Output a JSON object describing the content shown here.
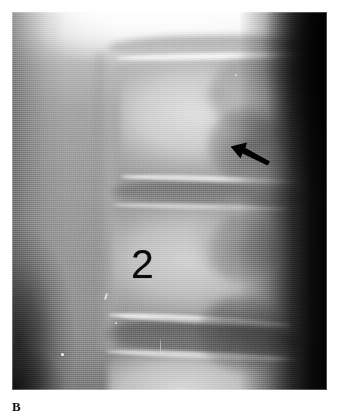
{
  "figure": {
    "panel_label": "B",
    "modality_name": "radiograph",
    "view_name": "lateral-lumbar-spine"
  },
  "radiograph": {
    "alt_description": "Lateral radiograph of the lumbar spine",
    "background_color": "#8d8d8d",
    "plate": {
      "left": 12,
      "top": 12,
      "width": 315,
      "height": 378
    },
    "tones": {
      "highlight": "#ffffff",
      "bone_bright": "#e2e2e2",
      "soft_tissue_mid": "#9a9a9a",
      "disc_dark": "#5e5e5e",
      "off_film_black": "#020202"
    }
  },
  "annotations": {
    "arrow": {
      "name": "pointer-arrow",
      "color": "#000000",
      "direction": "up-left",
      "tip_x": 219,
      "tip_y": 134,
      "tail_x": 256,
      "tail_y": 152
    },
    "vertebra_marker": {
      "label": "2",
      "color": "#0b0b0b",
      "x": 122,
      "y": 238
    },
    "specks": [
      {
        "name": "emulsion-speck-1",
        "x": 49,
        "y": 341
      },
      {
        "name": "emulsion-speck-2",
        "x": 93,
        "y": 281
      },
      {
        "name": "emulsion-speck-3",
        "x": 103,
        "y": 310
      },
      {
        "name": "emulsion-speck-4",
        "x": 148,
        "y": 327
      },
      {
        "name": "emulsion-speck-5",
        "x": 223,
        "y": 62
      }
    ]
  },
  "anatomy_labels": {
    "vertebral_body_upper": "vertebral body",
    "vertebral_body_marked": "vertebral body 2",
    "vertebral_body_lower": "vertebral body",
    "disc_space_upper": "intervertebral disc space",
    "disc_space_lower": "intervertebral disc space",
    "posterior_elements": "posterior elements",
    "anterior_margin": "anterior vertebral margin",
    "soft_tissue": "paraspinal soft tissue"
  }
}
